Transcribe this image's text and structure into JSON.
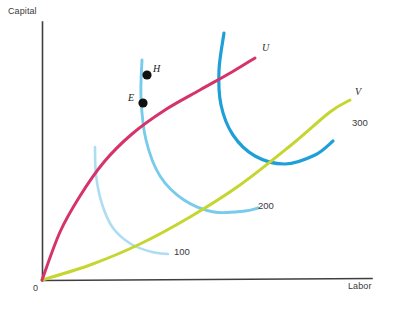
{
  "chart_data": {
    "type": "line",
    "title": "",
    "xlabel": "Labor",
    "ylabel": "Capital",
    "grid": false,
    "legend": "inline-curve-labels",
    "origin_label": "0",
    "axis_ranges": {
      "x": [
        0,
        100
      ],
      "y": [
        0,
        100
      ]
    },
    "series": [
      {
        "name": "U",
        "label": "U",
        "kind": "expansion-path",
        "color": "#d6336c",
        "label_pos": {
          "x": 262,
          "y": 42
        },
        "points": [
          [
            42,
            280
          ],
          [
            60,
            232
          ],
          [
            80,
            196
          ],
          [
            104,
            162
          ],
          [
            132,
            134
          ],
          [
            165,
            110
          ],
          [
            200,
            90
          ],
          [
            232,
            72
          ],
          [
            255,
            58
          ]
        ]
      },
      {
        "name": "V",
        "label": "V",
        "kind": "expansion-path",
        "color": "#c5d630",
        "label_pos": {
          "x": 355,
          "y": 86
        },
        "points": [
          [
            42,
            280
          ],
          [
            90,
            265
          ],
          [
            140,
            244
          ],
          [
            190,
            217
          ],
          [
            240,
            185
          ],
          [
            290,
            146
          ],
          [
            330,
            112
          ],
          [
            350,
            100
          ]
        ]
      },
      {
        "name": "100",
        "label": "100",
        "kind": "isoquant",
        "color": "#aeddf2",
        "label_pos": {
          "x": 174,
          "y": 246
        },
        "points": [
          [
            95,
            147
          ],
          [
            96,
            175
          ],
          [
            102,
            204
          ],
          [
            113,
            228
          ],
          [
            131,
            244
          ],
          [
            152,
            252
          ],
          [
            168,
            254
          ]
        ]
      },
      {
        "name": "200",
        "label": "200",
        "kind": "isoquant",
        "color": "#79cbeb",
        "label_pos": {
          "x": 258,
          "y": 200
        },
        "points": [
          [
            142,
            60
          ],
          [
            141,
            98
          ],
          [
            146,
            140
          ],
          [
            160,
            176
          ],
          [
            184,
            200
          ],
          [
            214,
            212
          ],
          [
            245,
            211
          ],
          [
            258,
            208
          ]
        ]
      },
      {
        "name": "300",
        "label": "300",
        "kind": "isoquant",
        "color": "#1f9fd8",
        "label_pos": {
          "x": 352,
          "y": 117
        },
        "points": [
          [
            224,
            33
          ],
          [
            219,
            70
          ],
          [
            221,
            105
          ],
          [
            233,
            135
          ],
          [
            255,
            156
          ],
          [
            285,
            164
          ],
          [
            315,
            155
          ],
          [
            333,
            141
          ]
        ]
      }
    ],
    "points": [
      {
        "name": "E",
        "label": "E",
        "x": 143,
        "y": 103,
        "label_pos": {
          "x": 128,
          "y": 92
        }
      },
      {
        "name": "H",
        "label": "H",
        "x": 147,
        "y": 75,
        "label_pos": {
          "x": 153,
          "y": 63
        }
      }
    ],
    "colors": {
      "axis": "#3f3f3f",
      "u_curve": "#d6336c",
      "v_curve": "#c5d630",
      "iso_100": "#aeddf2",
      "iso_200": "#79cbeb",
      "iso_300": "#1f9fd8",
      "point": "#111111",
      "text": "#3a3a3a"
    }
  }
}
